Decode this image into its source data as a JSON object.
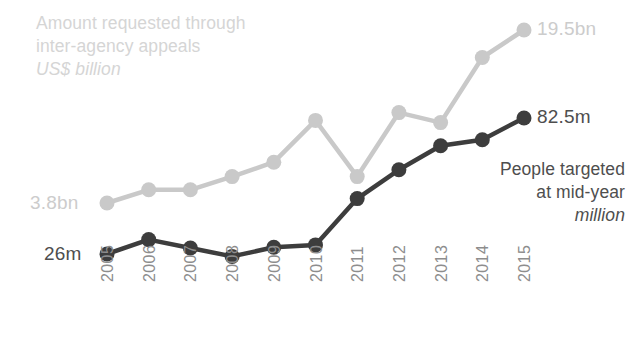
{
  "chart_data": {
    "type": "line",
    "title": "",
    "xlabel": "",
    "ylabel": "",
    "grid": false,
    "legend_position": "inline-annotations",
    "categories": [
      "2005",
      "2006",
      "2007",
      "2008",
      "2009",
      "2010",
      "2011",
      "2012",
      "2013",
      "2014",
      "2015"
    ],
    "series": [
      {
        "name": "Amount requested through inter-agency appeals",
        "unit": "US$ billion",
        "color": "#c9c9c9",
        "start_label": "3.8bn",
        "end_label": "19.5bn",
        "values": [
          3.8,
          5.0,
          5.0,
          6.2,
          7.5,
          11.3,
          6.2,
          12.0,
          11.1,
          17.0,
          19.5
        ]
      },
      {
        "name": "People targeted at mid-year",
        "unit": "million",
        "color": "#3d3d3d",
        "start_label": "26m",
        "end_label": "82.5m",
        "values": [
          26.0,
          32.0,
          28.5,
          25.0,
          28.8,
          29.8,
          49.0,
          61.0,
          71.0,
          73.5,
          82.5
        ]
      }
    ]
  },
  "annotations": {
    "light_series_caption": {
      "line1": "Amount requested through",
      "line2": "inter-agency appeals",
      "unit": "US$ billion"
    },
    "dark_series_caption": {
      "line1": "People targeted",
      "line2": "at mid-year",
      "unit": "million"
    },
    "light_start_value": "3.8bn",
    "light_end_value": "19.5bn",
    "dark_start_value": "26m",
    "dark_end_value": "82.5m"
  },
  "x_axis": {
    "ticks": [
      "2005",
      "2006",
      "2007",
      "2008",
      "2009",
      "2010",
      "2011",
      "2012",
      "2013",
      "2014",
      "2015"
    ]
  },
  "colors": {
    "light_series": "#c9c9c9",
    "dark_series": "#3d3d3d",
    "light_text": "#d5d5d5",
    "dark_text": "#4e4e4e",
    "tick_text": "#8d8d8d",
    "background": "#ffffff"
  }
}
